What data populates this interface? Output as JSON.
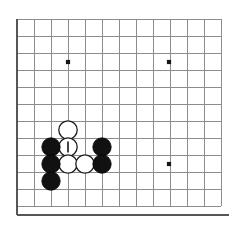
{
  "figure": {
    "kind": "go-board-diagram",
    "background_color": "#ffffff"
  },
  "board": {
    "type": "partial-go-board",
    "origin_x": 17,
    "origin_y": 19,
    "spacing": 17,
    "columns": 13,
    "rows": 12,
    "grid_color": "#8c8c8c",
    "edge_color": "#55555a",
    "edge_sides": [
      "left",
      "bottom"
    ],
    "edges": [
      {
        "name": "left-board-edge",
        "x1": 17,
        "y1": 19,
        "x2": 17,
        "y2": 215
      },
      {
        "name": "bottom-board-edge",
        "x1": 17,
        "y1": 215,
        "x2": 229,
        "y2": 215
      }
    ],
    "star_points": [
      {
        "name": "star-point-upper-left",
        "col": 3,
        "row": 2,
        "x": 68,
        "y": 62
      },
      {
        "name": "star-point-upper-right",
        "col": 9,
        "row": 2,
        "x": 169,
        "y": 62
      },
      {
        "name": "star-point-lower-right",
        "col": 9,
        "row": 8,
        "x": 169,
        "y": 164
      }
    ]
  },
  "stones": [
    {
      "name": "white-stone-a",
      "color": "white",
      "col": 3,
      "row": 6,
      "x": 68,
      "y": 130,
      "marked": false
    },
    {
      "name": "white-stone-marked",
      "color": "white",
      "col": 3,
      "row": 7,
      "x": 68,
      "y": 147,
      "marked": true,
      "marker": "vertical-bar"
    },
    {
      "name": "white-stone-b",
      "color": "white",
      "col": 3,
      "row": 8,
      "x": 68,
      "y": 164,
      "marked": false
    },
    {
      "name": "white-stone-c",
      "color": "white",
      "col": 4,
      "row": 8,
      "x": 85,
      "y": 164,
      "marked": false
    },
    {
      "name": "black-stone-a",
      "color": "black",
      "col": 2,
      "row": 7,
      "x": 51,
      "y": 147,
      "marked": false
    },
    {
      "name": "black-stone-b",
      "color": "black",
      "col": 2,
      "row": 8,
      "x": 51,
      "y": 164,
      "marked": false
    },
    {
      "name": "black-stone-c",
      "color": "black",
      "col": 2,
      "row": 9,
      "x": 51,
      "y": 181,
      "marked": false
    },
    {
      "name": "black-stone-d",
      "color": "black",
      "col": 5,
      "row": 7,
      "x": 102,
      "y": 147,
      "marked": false
    },
    {
      "name": "black-stone-e",
      "color": "black",
      "col": 5,
      "row": 8,
      "x": 102,
      "y": 164,
      "marked": false
    }
  ],
  "style": {
    "stone_radius": 9.2,
    "star_radius": 2.1,
    "marker_half_length": 5.5,
    "black_fill": "#111111",
    "white_fill": "#ffffff",
    "stone_outline": "#1b1b1b",
    "marker_color": "#141414"
  }
}
